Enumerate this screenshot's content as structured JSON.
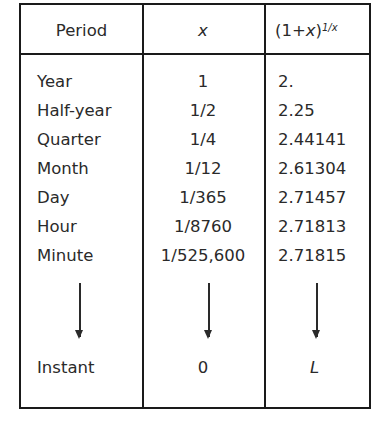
{
  "table": {
    "headers": {
      "period": "Period",
      "x": "x",
      "expr_base": "(1+",
      "expr_var": "x",
      "expr_close": ")",
      "expr_exp": "1/x"
    },
    "rows": [
      {
        "period": "Year",
        "x": "1",
        "value": "2."
      },
      {
        "period": "Half-year",
        "x": "1/2",
        "value": "2.25"
      },
      {
        "period": "Quarter",
        "x": "1/4",
        "value": "2.44141"
      },
      {
        "period": "Month",
        "x": "1/12",
        "value": "2.61304"
      },
      {
        "period": "Day",
        "x": "1/365",
        "value": "2.71457"
      },
      {
        "period": "Hour",
        "x": "1/8760",
        "value": "2.71813"
      },
      {
        "period": "Minute",
        "x": "1/525,600",
        "value": "2.71815"
      }
    ],
    "limit_row": {
      "period": "Instant",
      "x": "0",
      "value": "L"
    },
    "arrow_icon": "down-arrow-icon"
  }
}
